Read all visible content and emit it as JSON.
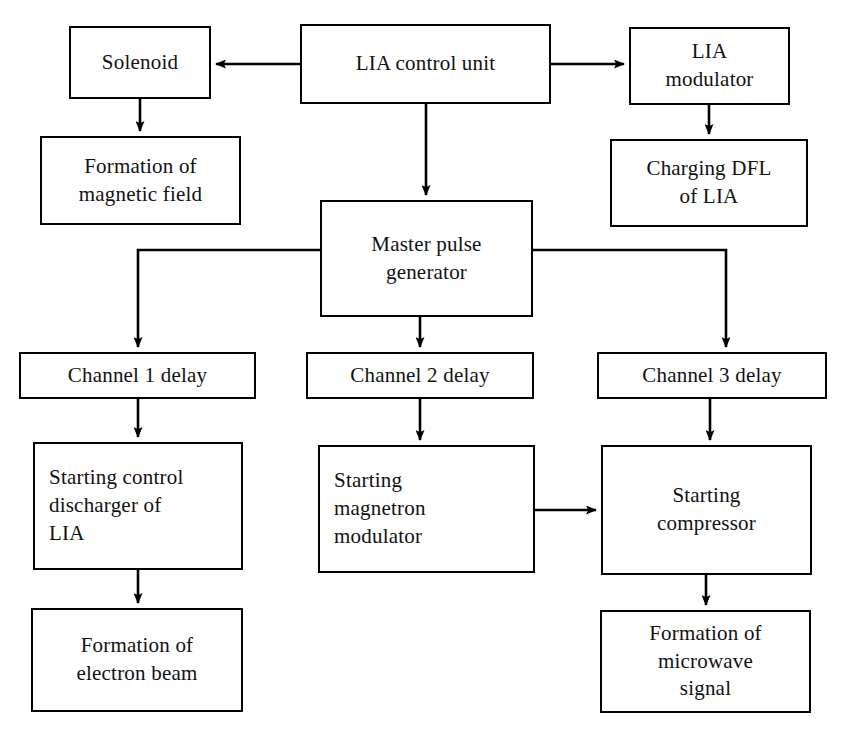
{
  "diagram": {
    "type": "block-diagram",
    "background_color": "#ffffff",
    "line_color": "#000000",
    "text_color": "#111111",
    "nodes": [
      {
        "id": "solenoid",
        "label": "Solenoid",
        "x": 69,
        "y": 26,
        "w": 142,
        "h": 73,
        "align": "center"
      },
      {
        "id": "lia-control-unit",
        "label": "LIA control unit",
        "x": 300,
        "y": 24,
        "w": 251,
        "h": 80,
        "align": "center"
      },
      {
        "id": "lia-modulator",
        "label": "LIA\nmodulator",
        "x": 629,
        "y": 27,
        "w": 161,
        "h": 78,
        "align": "center"
      },
      {
        "id": "formation-magnetic-field",
        "label": "Formation of\nmagnetic field",
        "x": 40,
        "y": 136,
        "w": 201,
        "h": 89,
        "align": "center"
      },
      {
        "id": "charging-dfl-of-lia",
        "label": "Charging DFL\nof LIA",
        "x": 610,
        "y": 139,
        "w": 198,
        "h": 88,
        "align": "center"
      },
      {
        "id": "master-pulse-generator",
        "label": "Master pulse\ngenerator",
        "x": 320,
        "y": 200,
        "w": 213,
        "h": 117,
        "align": "center"
      },
      {
        "id": "channel-1-delay",
        "label": "Channel 1 delay",
        "x": 19,
        "y": 352,
        "w": 237,
        "h": 47,
        "align": "center"
      },
      {
        "id": "channel-2-delay",
        "label": "Channel 2 delay",
        "x": 306,
        "y": 352,
        "w": 228,
        "h": 47,
        "align": "center"
      },
      {
        "id": "channel-3-delay",
        "label": "Channel 3 delay",
        "x": 597,
        "y": 352,
        "w": 230,
        "h": 47,
        "align": "center"
      },
      {
        "id": "starting-control-discharger-of-lia",
        "label": "Starting control\ndischarger of\nLIA",
        "x": 33,
        "y": 442,
        "w": 210,
        "h": 128,
        "align": "left"
      },
      {
        "id": "starting-magnetron-modulator",
        "label": "Starting\nmagnetron\nmodulator",
        "x": 318,
        "y": 445,
        "w": 217,
        "h": 128,
        "align": "left"
      },
      {
        "id": "starting-compressor",
        "label": "Starting\ncompressor",
        "x": 601,
        "y": 445,
        "w": 211,
        "h": 130,
        "align": "center"
      },
      {
        "id": "formation-electron-beam",
        "label": "Formation of\nelectron beam",
        "x": 31,
        "y": 608,
        "w": 212,
        "h": 104,
        "align": "center"
      },
      {
        "id": "formation-microwave-signal",
        "label": "Formation of\nmicrowave\nsignal",
        "x": 600,
        "y": 610,
        "w": 211,
        "h": 103,
        "align": "center"
      }
    ],
    "connections": [
      {
        "id": "lia-control-to-solenoid",
        "from": "lia-control-unit",
        "to": "solenoid",
        "kind": "arrow-left"
      },
      {
        "id": "lia-control-to-lia-modulator",
        "from": "lia-control-unit",
        "to": "lia-modulator",
        "kind": "arrow-right"
      },
      {
        "id": "lia-control-to-master-pulse-generator",
        "from": "lia-control-unit",
        "to": "master-pulse-generator",
        "kind": "arrow-down"
      },
      {
        "id": "solenoid-to-formation-magnetic-field",
        "from": "solenoid",
        "to": "formation-magnetic-field",
        "kind": "arrow-down"
      },
      {
        "id": "lia-modulator-to-charging-dfl",
        "from": "lia-modulator",
        "to": "charging-dfl-of-lia",
        "kind": "arrow-down"
      },
      {
        "id": "master-pulse-to-channel-1",
        "from": "master-pulse-generator",
        "to": "channel-1-delay",
        "kind": "elbow-left-down"
      },
      {
        "id": "master-pulse-to-channel-2",
        "from": "master-pulse-generator",
        "to": "channel-2-delay",
        "kind": "arrow-down"
      },
      {
        "id": "master-pulse-to-channel-3",
        "from": "master-pulse-generator",
        "to": "channel-3-delay",
        "kind": "elbow-right-down"
      },
      {
        "id": "channel-1-to-starting-control-discharger",
        "from": "channel-1-delay",
        "to": "starting-control-discharger-of-lia",
        "kind": "arrow-down"
      },
      {
        "id": "channel-2-to-starting-magnetron-modulator",
        "from": "channel-2-delay",
        "to": "starting-magnetron-modulator",
        "kind": "arrow-down"
      },
      {
        "id": "channel-3-to-starting-compressor",
        "from": "channel-3-delay",
        "to": "starting-compressor",
        "kind": "arrow-down"
      },
      {
        "id": "starting-magnetron-to-starting-compressor",
        "from": "starting-magnetron-modulator",
        "to": "starting-compressor",
        "kind": "arrow-right"
      },
      {
        "id": "starting-control-discharger-to-formation-electron-beam",
        "from": "starting-control-discharger-of-lia",
        "to": "formation-electron-beam",
        "kind": "arrow-down"
      },
      {
        "id": "starting-compressor-to-formation-microwave-signal",
        "from": "starting-compressor",
        "to": "formation-microwave-signal",
        "kind": "arrow-down"
      }
    ]
  }
}
